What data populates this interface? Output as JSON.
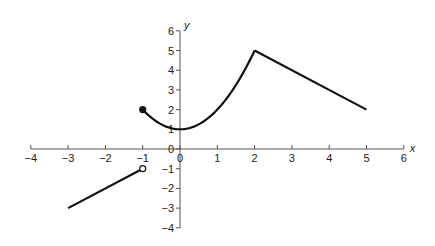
{
  "chart_data": {
    "type": "line",
    "title": "",
    "xlabel": "x",
    "ylabel": "y",
    "xlim": [
      -4,
      6
    ],
    "ylim": [
      -4,
      6
    ],
    "grid": false,
    "x_ticks": [
      -4,
      -3,
      -2,
      -1,
      0,
      1,
      2,
      3,
      4,
      5,
      6
    ],
    "y_ticks": [
      -4,
      -3,
      -2,
      -1,
      0,
      1,
      2,
      3,
      4,
      5,
      6
    ],
    "series": [
      {
        "name": "segment-left",
        "kind": "line",
        "points": [
          [
            -3,
            -3
          ],
          [
            -1,
            -1
          ]
        ],
        "endpoint_right": "open"
      },
      {
        "name": "segment-curve",
        "kind": "curve",
        "formula": "y = x^2 + 1",
        "domain": [
          -1,
          2
        ],
        "points": [
          [
            -1,
            2
          ],
          [
            -0.5,
            1.25
          ],
          [
            0,
            1
          ],
          [
            0.5,
            1.25
          ],
          [
            1,
            2
          ],
          [
            1.5,
            3.25
          ],
          [
            2,
            5
          ]
        ],
        "endpoint_left": "closed"
      },
      {
        "name": "segment-right",
        "kind": "line",
        "points": [
          [
            2,
            5
          ],
          [
            5,
            2
          ]
        ]
      }
    ],
    "markers": [
      {
        "x": -1,
        "y": -1,
        "style": "open"
      },
      {
        "x": -1,
        "y": 2,
        "style": "filled"
      }
    ]
  },
  "layout": {
    "origin_px": [
      180,
      149
    ],
    "x_unit_px": 37.3,
    "y_unit_px": 19.7,
    "axis_color": "#555555",
    "curve_color": "#111111"
  }
}
